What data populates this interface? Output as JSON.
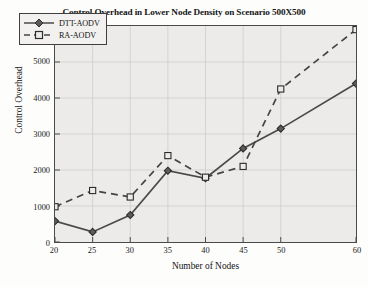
{
  "chart_data": {
    "type": "line",
    "title": "Control Overhead in Lower Node Density on Scenario 500X500",
    "xlabel": "Number of Nodes",
    "ylabel": "Control Overhead",
    "x": [
      20,
      25,
      30,
      35,
      40,
      45,
      50,
      60
    ],
    "categories": [
      "20",
      "25",
      "30",
      "35",
      "40",
      "45",
      "50",
      "60"
    ],
    "xlim": [
      20,
      60
    ],
    "ylim": [
      0,
      6000
    ],
    "xticks": [
      "20",
      "25",
      "30",
      "35",
      "40",
      "45",
      "50",
      "60"
    ],
    "xtick_values": [
      20,
      25,
      30,
      35,
      40,
      45,
      50,
      60
    ],
    "yticks": [
      "0",
      "1000",
      "2000",
      "3000",
      "4000",
      "5000",
      "6000"
    ],
    "ytick_values": [
      0,
      1000,
      2000,
      3000,
      4000,
      5000,
      6000
    ],
    "grid": true,
    "legend_position": "upper left",
    "series": [
      {
        "name": "DTT-AODV",
        "values": [
          580,
          280,
          750,
          1980,
          1770,
          2600,
          3150,
          4400
        ],
        "line_style": "solid",
        "marker": "diamond",
        "color": "#4a4a4a"
      },
      {
        "name": "RA-AODV",
        "values": [
          980,
          1430,
          1250,
          2400,
          1800,
          2100,
          4250,
          5900
        ],
        "line_style": "dashed",
        "marker": "square",
        "color": "#444444"
      }
    ]
  },
  "figure": {
    "plot_background": "#ecebe9",
    "axis_color": "#4a4a4a",
    "grid_color": "#cfcdc9",
    "text_color": "#161616"
  }
}
